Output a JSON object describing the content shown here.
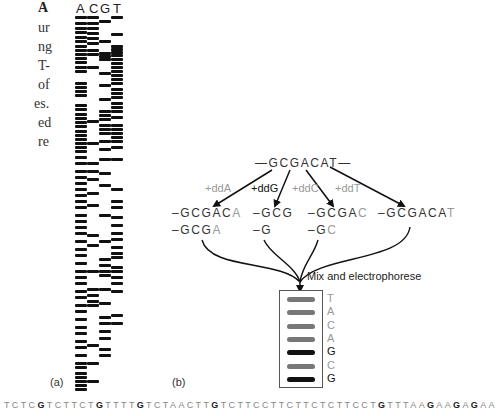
{
  "left_text": {
    "fragments": [
      {
        "text": "A",
        "bold": true,
        "y": 0
      },
      {
        "text": "ur",
        "bold": false,
        "y": 20
      },
      {
        "text": "ng",
        "bold": false,
        "y": 39
      },
      {
        "text": "T-",
        "bold": false,
        "y": 58
      },
      {
        "text": "of",
        "bold": false,
        "y": 77
      },
      {
        "text": "es.",
        "bold": false,
        "y": 96
      },
      {
        "text": "ed",
        "bold": false,
        "y": 115
      },
      {
        "text": "re",
        "bold": false,
        "y": 134
      }
    ]
  },
  "panel_a": {
    "label": "(a)",
    "lane_headers": [
      "A",
      "C",
      "G",
      "T"
    ],
    "lanes": [
      {
        "name": "A",
        "x": 75,
        "w": 12,
        "bands": [
          16,
          22,
          27,
          31,
          36,
          40,
          45,
          49,
          53,
          57,
          61,
          66,
          70,
          82,
          86,
          90,
          94,
          104,
          108,
          113,
          117,
          121,
          125,
          130,
          134,
          138,
          142,
          146,
          150,
          156,
          162,
          170,
          176,
          182,
          188,
          194,
          200,
          206,
          214,
          220,
          226,
          232,
          240,
          248,
          254,
          262,
          270,
          276,
          282,
          290,
          296,
          304,
          310,
          318,
          326,
          332,
          340,
          346,
          354,
          362,
          366,
          372,
          376,
          380,
          384,
          388
        ]
      },
      {
        "name": "C",
        "x": 87,
        "w": 12,
        "bands": [
          16,
          22,
          27,
          32,
          37,
          42,
          49,
          53,
          66,
          120,
          142,
          162,
          170,
          178,
          192,
          204,
          234,
          244,
          270,
          288,
          294,
          300,
          304,
          344,
          362,
          380
        ]
      },
      {
        "name": "G",
        "x": 99,
        "w": 12,
        "bands": [
          20,
          40,
          52,
          55,
          58,
          72,
          84,
          98,
          110,
          114,
          118,
          124,
          128,
          132,
          140,
          148,
          158,
          172,
          184,
          214,
          240,
          258,
          264,
          270,
          274,
          288,
          302,
          316,
          322,
          330,
          337,
          348,
          354
        ]
      },
      {
        "name": "T",
        "x": 111,
        "w": 12,
        "bands": [
          16,
          33,
          45,
          48,
          51,
          54,
          58,
          62,
          66,
          70,
          74,
          78,
          82,
          88,
          92,
          96,
          102,
          106,
          110,
          116,
          124,
          128,
          132,
          136,
          140,
          146,
          158,
          188,
          200,
          206,
          216,
          224,
          232,
          238,
          246,
          252,
          256,
          266,
          270,
          276,
          282,
          290,
          314,
          322
        ]
      }
    ]
  },
  "panel_b": {
    "label": "(b)",
    "template_strand": {
      "prefix": "—",
      "seq": "GCGACAT",
      "suffix": "—"
    },
    "reactions": [
      {
        "label": "+ddA",
        "dark": false
      },
      {
        "label": "+ddG",
        "dark": true
      },
      {
        "label": "+ddC",
        "dark": false
      },
      {
        "label": "+ddT",
        "dark": false
      }
    ],
    "products": [
      {
        "lines": [
          {
            "body": "–GCGAC",
            "term": "A"
          },
          {
            "body": "–GCG",
            "term": "A"
          }
        ]
      },
      {
        "lines": [
          {
            "body": "–GCG",
            "term": ""
          },
          {
            "body": "–G",
            "term": ""
          }
        ]
      },
      {
        "lines": [
          {
            "body": "–GCGA",
            "term": "C"
          },
          {
            "body": "–G",
            "term": "C"
          }
        ]
      },
      {
        "lines": [
          {
            "body": "–GCGACA",
            "term": "T"
          }
        ]
      }
    ],
    "mix_label": "Mix and electrophorese",
    "gel_bands": [
      {
        "base": "T",
        "color": "#777777",
        "dark": false
      },
      {
        "base": "A",
        "color": "#777777",
        "dark": false
      },
      {
        "base": "C",
        "color": "#777777",
        "dark": false
      },
      {
        "base": "A",
        "color": "#777777",
        "dark": false
      },
      {
        "base": "G",
        "color": "#111111",
        "dark": true
      },
      {
        "base": "C",
        "color": "#777777",
        "dark": false
      },
      {
        "base": "G",
        "color": "#111111",
        "dark": true
      }
    ]
  },
  "bottom_sequence": "TCTCGTCTTCTGTTTTGTCTAACTTGTCTTCCTTCTTCTCTTCCTGTTTAAGAAGAGAA"
}
